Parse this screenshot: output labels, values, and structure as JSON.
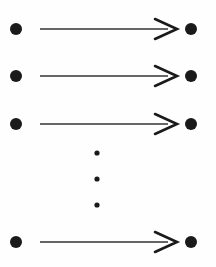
{
  "figure": {
    "width": 216,
    "height": 267,
    "background_color": "#fefefe",
    "ink_color": "#1a1a1a",
    "line_color": "#333333"
  },
  "geometry": {
    "source_dot_x": 16,
    "target_dot_x": 191,
    "dot_radius": 6.0,
    "line_start_x": 40,
    "line_end_x": 168,
    "line_width": 1.6,
    "arrowhead_tip_x": 177,
    "arrowhead_back_x": 155,
    "arrowhead_half_height": 10,
    "arrowhead_width": 2.6,
    "ellipsis_x": 97,
    "ellipsis_radius": 2.6
  },
  "rows": [
    {
      "id": "row-1",
      "y": 29,
      "kind": "arrow",
      "label": ""
    },
    {
      "id": "row-2",
      "y": 76,
      "kind": "arrow",
      "label": ""
    },
    {
      "id": "row-3",
      "y": 124,
      "kind": "arrow",
      "label": ""
    },
    {
      "id": "row-4",
      "y": 242,
      "kind": "arrow",
      "label": ""
    }
  ],
  "ellipsis": {
    "id": "vertical-ellipsis",
    "dots_y": [
      153,
      179,
      205
    ],
    "count": 3
  },
  "chart_data": {
    "type": "diagram",
    "xlabel": "",
    "ylabel": "",
    "arrow_count": 4,
    "visible_arrow_rows": 4,
    "ellipsis_dot_count": 3,
    "node_count": 8,
    "arrows": [
      {
        "from": {
          "x": 16,
          "y": 29
        },
        "to": {
          "x": 191,
          "y": 29
        },
        "direction": "right"
      },
      {
        "from": {
          "x": 16,
          "y": 76
        },
        "to": {
          "x": 191,
          "y": 76
        },
        "direction": "right"
      },
      {
        "from": {
          "x": 16,
          "y": 124
        },
        "to": {
          "x": 191,
          "y": 124
        },
        "direction": "right"
      },
      {
        "from": {
          "x": 16,
          "y": 242
        },
        "to": {
          "x": 191,
          "y": 242
        },
        "direction": "right"
      }
    ],
    "ellipsis_points": [
      {
        "x": 97,
        "y": 153
      },
      {
        "x": 97,
        "y": 179
      },
      {
        "x": 97,
        "y": 205
      }
    ]
  }
}
